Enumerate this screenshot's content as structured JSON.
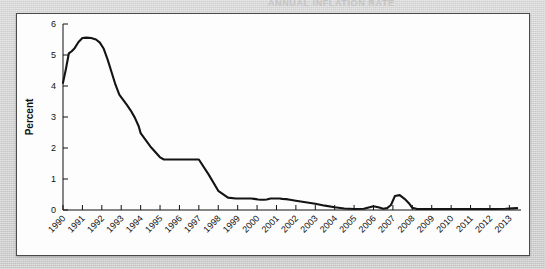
{
  "page": {
    "background_color": "#d2d2d2",
    "panel_color": "#fdfdfd",
    "clipped_top_text": "ANNUAL INFLATION RATE"
  },
  "chart_data": {
    "type": "line",
    "title": "",
    "subtitle": "",
    "xlabel": "",
    "ylabel": "Percent",
    "grid": false,
    "legend": "none",
    "line_color": "#141414",
    "xlim": [
      1990,
      2013.6
    ],
    "ylim": [
      0,
      6
    ],
    "ytick_labels": [
      "0",
      "1",
      "2",
      "3",
      "4",
      "5",
      "6"
    ],
    "ytick_values": [
      0,
      1,
      2,
      3,
      4,
      5,
      6
    ],
    "xtick_labels": [
      "1990",
      "1991",
      "1992",
      "1993",
      "1994",
      "1995",
      "1996",
      "1997",
      "1998",
      "1999",
      "2000",
      "2001",
      "2002",
      "2003",
      "2004",
      "2005",
      "2006",
      "2007",
      "2008",
      "2009",
      "2010",
      "2011",
      "2012",
      "2013"
    ],
    "xtick_values": [
      1990,
      1991,
      1992,
      1993,
      1994,
      1995,
      1996,
      1997,
      1998,
      1999,
      2000,
      2001,
      2002,
      2003,
      2004,
      2005,
      2006,
      2007,
      2008,
      2009,
      2010,
      2011,
      2012,
      2013
    ],
    "series": [
      {
        "name": "Percent",
        "x": [
          1990.0,
          1990.15,
          1990.3,
          1990.45,
          1990.6,
          1990.8,
          1991.0,
          1991.2,
          1991.45,
          1991.7,
          1991.9,
          1992.1,
          1992.3,
          1992.5,
          1992.7,
          1992.9,
          1993.1,
          1993.3,
          1993.5,
          1993.7,
          1993.9,
          1994.0,
          1994.5,
          1995.0,
          1995.2,
          1995.4,
          1995.6,
          1995.8,
          1996.0,
          1996.5,
          1997.0,
          1997.5,
          1998.0,
          1998.5,
          1998.9,
          1999.1,
          1999.3,
          1999.5,
          1999.7,
          1999.85,
          1999.95,
          2000.05,
          2000.2,
          2000.35,
          2000.5,
          2000.7,
          2000.85,
          2001.0,
          2001.15,
          2001.3,
          2001.5,
          2001.7,
          2002.0,
          2002.5,
          2003.0,
          2003.5,
          2004.0,
          2004.5,
          2005.0,
          2005.5,
          2006.0,
          2006.3,
          2006.5,
          2006.7,
          2006.9,
          2007.1,
          2007.35,
          2007.6,
          2007.85,
          2008.0,
          2008.25,
          2008.5,
          2008.75,
          2008.95,
          2009.1,
          2009.25,
          2009.4,
          2009.6,
          2009.85,
          2010.1,
          2010.4,
          2010.8,
          2011.2,
          2011.7,
          2012.2,
          2012.8,
          2013.4
        ],
        "y": [
          4.1,
          4.55,
          5.05,
          5.12,
          5.22,
          5.42,
          5.55,
          5.56,
          5.55,
          5.5,
          5.4,
          5.2,
          4.85,
          4.45,
          4.05,
          3.72,
          3.55,
          3.38,
          3.2,
          2.98,
          2.7,
          2.48,
          2.05,
          1.7,
          1.63,
          1.63,
          1.63,
          1.63,
          1.63,
          1.63,
          1.63,
          1.15,
          0.62,
          0.4,
          0.37,
          0.37,
          0.37,
          0.37,
          0.37,
          0.36,
          0.35,
          0.34,
          0.33,
          0.33,
          0.34,
          0.37,
          0.37,
          0.37,
          0.37,
          0.36,
          0.35,
          0.33,
          0.3,
          0.25,
          0.2,
          0.14,
          0.09,
          0.05,
          0.03,
          0.04,
          0.12,
          0.08,
          0.04,
          0.06,
          0.16,
          0.45,
          0.48,
          0.36,
          0.2,
          0.07,
          0.03,
          0.03,
          0.03,
          0.03,
          0.03,
          0.03,
          0.03,
          0.03,
          0.03,
          0.03,
          0.03,
          0.03,
          0.03,
          0.03,
          0.03,
          0.04,
          0.06
        ]
      }
    ],
    "annotations": [
      {
        "label": "peak",
        "x": 1991.1,
        "y": 5.56
      },
      {
        "label": "plateau",
        "x": 1995.0,
        "y": 1.63
      },
      {
        "label": "spike-2001",
        "x": 2001.0,
        "y": 0.48
      },
      {
        "label": "hump-2008",
        "x": 2008.0,
        "y": 0.62
      }
    ]
  }
}
